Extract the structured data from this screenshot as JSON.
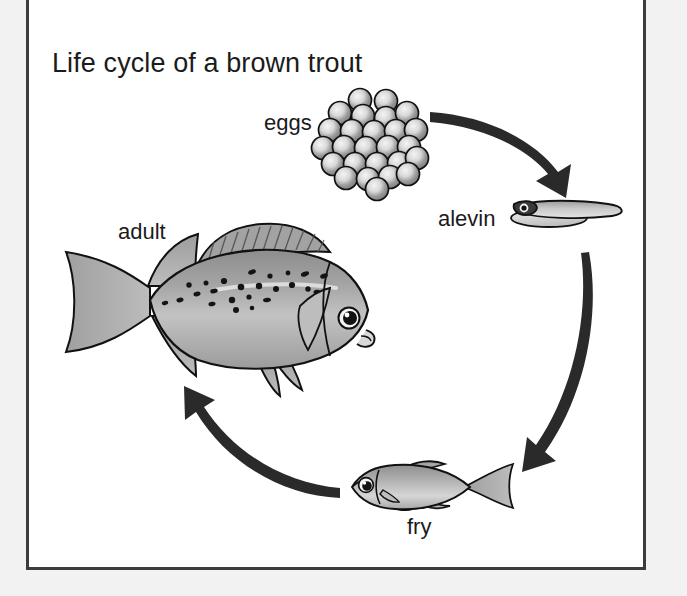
{
  "diagram": {
    "title": "Life cycle of a brown trout",
    "background_color": "#f2f2f2",
    "panel_color": "#ffffff",
    "panel_border_color": "#3c3c3c",
    "ink_color": "#1b1b1b",
    "stages": [
      {
        "id": "eggs",
        "label": "eggs",
        "label_x": 264,
        "label_y": 110
      },
      {
        "id": "alevin",
        "label": "alevin",
        "label_x": 438,
        "label_y": 206
      },
      {
        "id": "fry",
        "label": "fry",
        "label_x": 407,
        "label_y": 514
      },
      {
        "id": "adult",
        "label": "adult",
        "label_x": 118,
        "label_y": 219
      }
    ],
    "arrows": [
      {
        "id": "eggs-to-alevin",
        "from": "eggs",
        "to": "alevin",
        "direction": "down-right"
      },
      {
        "id": "alevin-to-fry",
        "from": "alevin",
        "to": "fry",
        "direction": "down-left"
      },
      {
        "id": "fry-to-adult",
        "from": "fry",
        "to": "adult",
        "direction": "up-left"
      }
    ],
    "egg_cluster": {
      "count": 26,
      "fill_center": "#8a8a8a",
      "fill_edge": "#f0f0f0",
      "stroke": "#111111"
    }
  }
}
